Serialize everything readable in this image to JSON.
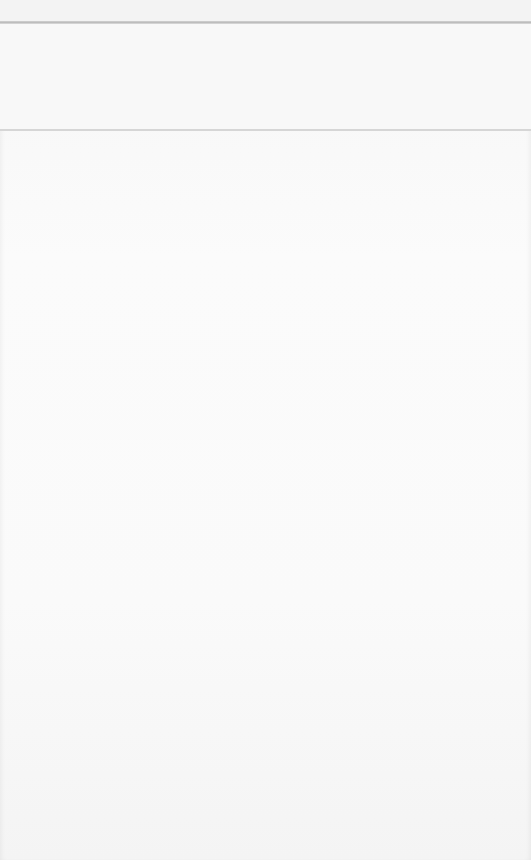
{
  "page": {
    "state": "blank",
    "header": {
      "title": ""
    },
    "content": {
      "text": ""
    }
  },
  "colors": {
    "background": "#f9f9f9",
    "top_rule": "#bdbdbd",
    "mid_rule": "#d6d6d6"
  }
}
